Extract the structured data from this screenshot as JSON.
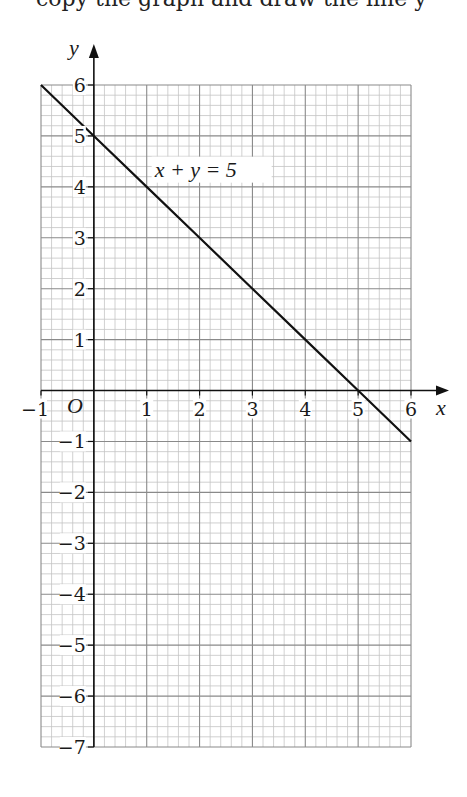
{
  "header": {
    "cutoff_text": "copy the graph and draw the line y"
  },
  "chart_data": {
    "type": "line",
    "title": "",
    "xlabel": "x",
    "ylabel": "y",
    "origin_label": "O",
    "xlim": [
      -1,
      6
    ],
    "ylim": [
      -7,
      6
    ],
    "x_ticks": [
      -1,
      1,
      2,
      3,
      4,
      5,
      6
    ],
    "y_ticks": [
      6,
      5,
      4,
      3,
      2,
      1,
      -1,
      -2,
      -3,
      -4,
      -5,
      -6,
      -7
    ],
    "x_tick_labels": [
      "−1",
      "1",
      "2",
      "3",
      "4",
      "5",
      "6"
    ],
    "y_tick_labels": [
      "6",
      "5",
      "4",
      "3",
      "2",
      "1",
      "−1",
      "−2",
      "−3",
      "−4",
      "−5",
      "−6",
      "−7"
    ],
    "grid": true,
    "minor_divisions_per_unit": 5,
    "series": [
      {
        "name": "x + y = 5",
        "label": "x + y = 5",
        "x": [
          -1,
          0,
          1,
          2,
          3,
          4,
          5,
          6
        ],
        "y": [
          6,
          5,
          4,
          3,
          2,
          1,
          0,
          -1
        ]
      }
    ],
    "annotations": [
      {
        "text": "x + y = 5",
        "x": 1.15,
        "y": 4.2
      }
    ],
    "colors": {
      "line": "#111111",
      "axis": "#111111",
      "grid_major": "#8a8a8a",
      "grid_minor": "#c4c4c4"
    }
  }
}
